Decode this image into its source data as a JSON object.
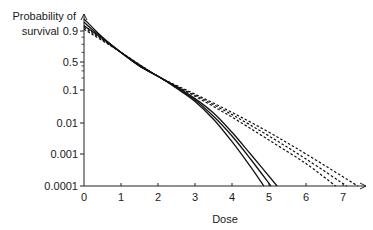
{
  "chart_data": {
    "type": "line",
    "title": "",
    "xlabel": "Dose",
    "ylabel": "Probability of survival",
    "ylabel_lines": [
      "Probability of",
      "survival"
    ],
    "xlim": [
      0,
      7.5
    ],
    "ylim": [
      0.0001,
      1
    ],
    "yscale": "log-transformed (survival)",
    "grid": false,
    "legend": null,
    "x_ticks": [
      0,
      1,
      2,
      3,
      4,
      5,
      6,
      7
    ],
    "x_tick_labels": [
      "0",
      "1",
      "2",
      "3",
      "4",
      "5",
      "6",
      "7"
    ],
    "y_ticks": [
      0.9,
      0.5,
      0.1,
      0.01,
      0.001,
      0.0001
    ],
    "y_tick_labels": [
      "0.9",
      "0.5",
      "0.1",
      "0.01",
      "0.001",
      "0.0001"
    ],
    "series": [
      {
        "name": "solid-1",
        "style": "solid",
        "x": [
          0,
          0.5,
          1,
          1.5,
          2,
          2.5,
          3,
          3.5,
          4,
          4.5,
          4.86
        ],
        "y": [
          0.97,
          0.8,
          0.6,
          0.4,
          0.22,
          0.11,
          0.045,
          0.013,
          0.0025,
          0.0004,
          0.0001
        ]
      },
      {
        "name": "solid-2",
        "style": "solid",
        "x": [
          0,
          0.5,
          1,
          1.5,
          2,
          2.5,
          3,
          3.5,
          4,
          4.5,
          5.05
        ],
        "y": [
          0.95,
          0.79,
          0.6,
          0.4,
          0.22,
          0.115,
          0.05,
          0.016,
          0.0038,
          0.0007,
          0.0001
        ]
      },
      {
        "name": "solid-3",
        "style": "solid",
        "x": [
          0,
          0.5,
          1,
          1.5,
          2,
          2.5,
          3,
          3.5,
          4,
          4.5,
          5.22
        ],
        "y": [
          0.93,
          0.78,
          0.6,
          0.4,
          0.22,
          0.12,
          0.055,
          0.02,
          0.005,
          0.001,
          0.0001
        ]
      },
      {
        "name": "dashed-1",
        "style": "dashed",
        "x": [
          0,
          1,
          2,
          3,
          4,
          5,
          6,
          6.8
        ],
        "y": [
          0.93,
          0.6,
          0.22,
          0.065,
          0.015,
          0.0028,
          0.0005,
          0.0001
        ]
      },
      {
        "name": "dashed-2",
        "style": "dashed",
        "x": [
          0,
          1,
          2,
          3,
          4,
          5,
          6,
          7.1
        ],
        "y": [
          0.92,
          0.6,
          0.22,
          0.07,
          0.018,
          0.0038,
          0.0007,
          0.0001
        ]
      },
      {
        "name": "dashed-3",
        "style": "dashed",
        "x": [
          0,
          1,
          2,
          3,
          4,
          5,
          6,
          7.4
        ],
        "y": [
          0.91,
          0.6,
          0.22,
          0.075,
          0.021,
          0.005,
          0.001,
          0.0001
        ]
      }
    ]
  },
  "layout": {
    "origin_px": [
      84,
      186
    ],
    "x_px_per_unit": 37,
    "x_axis_end_px": 366,
    "y_axis_top_px": 14,
    "y_tick_px": {
      "0.9": 31,
      "0.5": 62,
      "0.1": 90,
      "0.01": 123,
      "0.001": 154,
      "0.0001": 186
    }
  },
  "colors": {
    "axis": "#222222",
    "line": "#111111",
    "text": "#1a1a1a"
  }
}
